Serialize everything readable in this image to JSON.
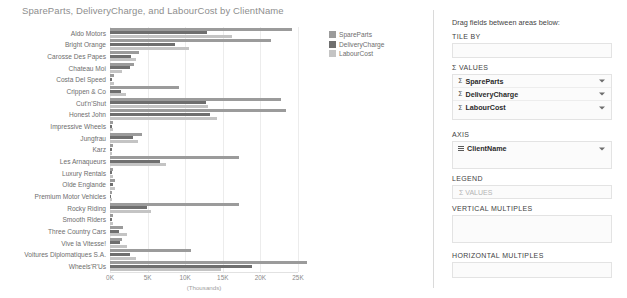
{
  "chart_data": {
    "type": "bar",
    "orientation": "horizontal",
    "title": "SpareParts, DeliveryCharge, and LabourCost by ClientName",
    "xlabel": "(Thousands)",
    "ylabel": "",
    "xlim": [
      0,
      25
    ],
    "xticks": [
      "0K",
      "5K",
      "10K",
      "15K",
      "20K",
      "25K"
    ],
    "xtick_values": [
      0,
      5,
      10,
      15,
      20,
      25
    ],
    "grid": true,
    "legend_position": "right",
    "categories": [
      "Aldo Motors",
      "Bright Orange",
      "Carosse Des Papes",
      "Chateau Moi",
      "Costa Del Speed",
      "Crippen & Co",
      "Cut'n'Shut",
      "Honest John",
      "Impressive Wheels",
      "Jungfrau",
      "Karz",
      "Les Arnaqueurs",
      "Luxury Rentals",
      "Olde Englande",
      "Premium Motor Vehicles",
      "Rocky Riding",
      "Smooth Riders",
      "Three Country Cars",
      "Vive la Vitesse!",
      "Voitures Diplomatiques S.A.",
      "Wheels'R'Us"
    ],
    "series": [
      {
        "name": "SpareParts",
        "color": "#9b9b9b",
        "values": [
          24.2,
          21.4,
          3.9,
          3.2,
          0.5,
          9.2,
          22.7,
          23.4,
          0.4,
          4.3,
          0.4,
          17.2,
          0.4,
          0.6,
          0.2,
          17.1,
          0.4,
          1.7,
          1.6,
          10.8,
          26.2
        ]
      },
      {
        "name": "DeliveryCharge",
        "color": "#6f6f6f",
        "values": [
          12.9,
          8.6,
          2.8,
          2.6,
          0.3,
          1.5,
          12.7,
          13.3,
          0.2,
          3.1,
          0.2,
          6.6,
          0.2,
          0.4,
          0.1,
          4.9,
          0.2,
          1.2,
          1.3,
          2.6,
          18.9
        ]
      },
      {
        "name": "LabourCost",
        "color": "#c4c4c4",
        "values": [
          16.2,
          10.5,
          3.4,
          1.6,
          0.5,
          2.1,
          13.0,
          14.2,
          0.4,
          3.7,
          0.3,
          7.4,
          0.4,
          0.7,
          0.2,
          5.4,
          0.4,
          2.3,
          2.2,
          3.4,
          14.8
        ]
      }
    ]
  },
  "legend": {
    "items": [
      {
        "label": "SpareParts",
        "color": "#9b9b9b"
      },
      {
        "label": "DeliveryCharge",
        "color": "#6f6f6f"
      },
      {
        "label": "LabourCost",
        "color": "#c4c4c4"
      }
    ]
  },
  "fieldwell": {
    "hint": "Drag fields between areas below:",
    "sections": [
      {
        "heading": "TILE BY",
        "chips": [],
        "ghost": ""
      },
      {
        "heading": "Σ VALUES",
        "chips": [
          {
            "icon": "sigma",
            "label": "SpareParts",
            "caret": true
          },
          {
            "icon": "sigma",
            "label": "DeliveryCharge",
            "caret": true
          },
          {
            "icon": "sigma",
            "label": "LabourCost",
            "caret": true
          }
        ],
        "ghost": ""
      },
      {
        "heading": "AXIS",
        "chips": [
          {
            "icon": "grid",
            "label": "ClientName",
            "caret": true
          }
        ],
        "ghost": ""
      },
      {
        "heading": "LEGEND",
        "chips": [],
        "ghost": "Σ VALUES"
      },
      {
        "heading": "VERTICAL MULTIPLES",
        "chips": [],
        "ghost": ""
      },
      {
        "heading": "HORIZONTAL MULTIPLES",
        "chips": [],
        "ghost": ""
      }
    ]
  }
}
